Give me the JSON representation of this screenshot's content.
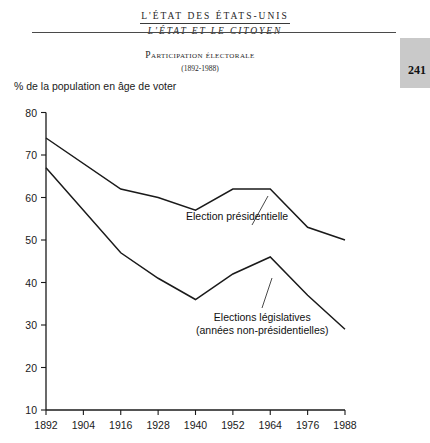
{
  "running_head": {
    "line1": "L'ÉTAT DES ÉTATS-UNIS",
    "line2": "L'ÉTAT ET LE CITOYEN"
  },
  "page_number": "241",
  "figure": {
    "title": "Participation électorale",
    "subtitle": "(1892-1988)",
    "axis_caption": "% de la population en âge de voter"
  },
  "colors": {
    "line": "#1a1a1a",
    "rule": "#4a4a4a",
    "page_tab": "#c9c9c9",
    "text": "#1a1a1a"
  },
  "annotations": {
    "presidential": "Election présidentielle",
    "legislative_line1": "Elections législatives",
    "legislative_line2": "(années non-présidentielles)"
  },
  "chart_data": {
    "type": "line",
    "title": "Participation électorale",
    "subtitle": "(1892-1988)",
    "xlabel": "",
    "ylabel": "% de la population en âge de voter",
    "xlim": [
      1892,
      1988
    ],
    "ylim": [
      10,
      80
    ],
    "ytick_labels": [
      "80",
      "70",
      "60",
      "50",
      "40",
      "30",
      "20",
      "10"
    ],
    "ytick_values": [
      80,
      70,
      60,
      50,
      40,
      30,
      20,
      10
    ],
    "xtick_labels": [
      "1892",
      "1904",
      "1916",
      "1928",
      "1940",
      "1952",
      "1964",
      "1976",
      "1988"
    ],
    "xtick_values": [
      1892,
      1904,
      1916,
      1928,
      1940,
      1952,
      1964,
      1976,
      1988
    ],
    "grid": false,
    "legend": "inline-annotations",
    "series": [
      {
        "name": "Election présidentielle",
        "x": [
          1892,
          1916,
          1928,
          1940,
          1952,
          1964,
          1976,
          1988
        ],
        "values": [
          74,
          62,
          60,
          57,
          62,
          62,
          53,
          50
        ]
      },
      {
        "name": "Elections législatives (années non-présidentielles)",
        "x": [
          1892,
          1916,
          1928,
          1940,
          1952,
          1964,
          1976,
          1988
        ],
        "values": [
          67,
          47,
          41,
          36,
          42,
          46,
          37,
          29
        ]
      }
    ]
  }
}
